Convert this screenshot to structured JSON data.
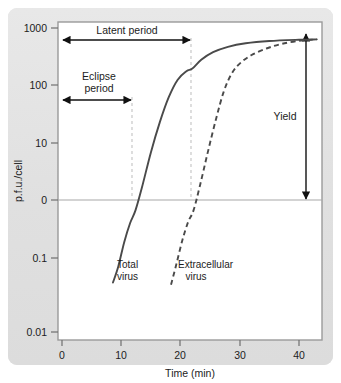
{
  "figure": {
    "background_color": "#e3e3e3",
    "plot_background_color": "#ffffff",
    "frame_color": "#9a9a9a",
    "curve_color": "#4a4a4a",
    "annotation_color": "#1c1c1c",
    "guide_color": "#c9c9c9"
  },
  "chart_data": {
    "type": "line",
    "title": "",
    "xlabel": "Time (min)",
    "ylabel": "p.f.u./cell",
    "xlim": [
      0,
      44
    ],
    "ylim_log": [
      -2,
      3
    ],
    "grid": false,
    "legend_position": "inline-labels",
    "xticks": [
      "0",
      "10",
      "20",
      "30",
      "40"
    ],
    "xtick_values": [
      0,
      10,
      20,
      30,
      40
    ],
    "yticks": [
      "1000",
      "100",
      "10",
      "0",
      "0.1",
      "0.01"
    ],
    "ytick_values": [
      1000,
      100,
      10,
      1,
      0.1,
      0.01
    ],
    "series": [
      {
        "name": "Total virus",
        "style": "solid",
        "points": [
          [
            8.6,
            0.065
          ],
          [
            9.5,
            0.12
          ],
          [
            10.5,
            0.3
          ],
          [
            11.5,
            0.62
          ],
          [
            12.4,
            1.0
          ],
          [
            13.5,
            2.4
          ],
          [
            15.0,
            9.0
          ],
          [
            16.5,
            28
          ],
          [
            18.0,
            72
          ],
          [
            19.5,
            140
          ],
          [
            21.0,
            195
          ],
          [
            22.0,
            215
          ],
          [
            23.5,
            300
          ],
          [
            25.5,
            400
          ],
          [
            28.0,
            490
          ],
          [
            31.0,
            560
          ],
          [
            35.0,
            610
          ],
          [
            40.0,
            640
          ],
          [
            43.0,
            650
          ]
        ]
      },
      {
        "name": "Extracellular virus",
        "style": "dashed",
        "points": [
          [
            18.4,
            0.06
          ],
          [
            19.3,
            0.13
          ],
          [
            20.3,
            0.32
          ],
          [
            21.3,
            0.65
          ],
          [
            22.2,
            1.0
          ],
          [
            23.3,
            2.6
          ],
          [
            24.6,
            9.0
          ],
          [
            26.0,
            32
          ],
          [
            27.3,
            90
          ],
          [
            28.6,
            175
          ],
          [
            30.0,
            260
          ],
          [
            32.0,
            360
          ],
          [
            34.5,
            460
          ],
          [
            37.0,
            545
          ],
          [
            40.0,
            615
          ],
          [
            43.0,
            650
          ]
        ]
      }
    ],
    "annotations": [
      {
        "name": "latent-period",
        "label": "Latent period",
        "kind": "horizontal-double-arrow",
        "x_start": 0,
        "x_end": 22,
        "y_value": 600
      },
      {
        "name": "eclipse-period",
        "label": "Eclipse period",
        "label_line1": "Eclipse",
        "label_line2": "period",
        "kind": "horizontal-double-arrow",
        "x_start": 0,
        "x_end": 12.5,
        "y_value": 70
      },
      {
        "name": "yield",
        "label": "Yield",
        "kind": "vertical-double-arrow",
        "x_value": 41.5,
        "y_start": 1,
        "y_end": 650
      }
    ],
    "guide_lines": [
      {
        "name": "eclipse-guide",
        "x_value": 12.5,
        "from_y": 70,
        "to_y": 1
      },
      {
        "name": "latent-guide",
        "x_value": 22,
        "from_y": 600,
        "to_y": 1
      }
    ],
    "baseline": {
      "name": "zero-line",
      "y_value": 1,
      "label": "0"
    }
  }
}
